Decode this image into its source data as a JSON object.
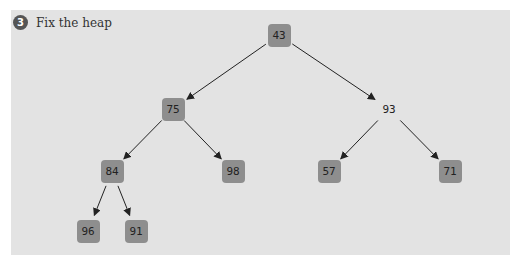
{
  "step": {
    "number": "3",
    "label": "Fix the heap"
  },
  "nodes": [
    {
      "id": "n0",
      "value": "43",
      "x": 279,
      "y": 35,
      "boxed": true
    },
    {
      "id": "n1",
      "value": "75",
      "x": 173,
      "y": 109,
      "boxed": true
    },
    {
      "id": "n2",
      "value": "93",
      "x": 389,
      "y": 109,
      "boxed": false
    },
    {
      "id": "n3",
      "value": "84",
      "x": 112,
      "y": 171,
      "boxed": true
    },
    {
      "id": "n4",
      "value": "98",
      "x": 233,
      "y": 171,
      "boxed": true
    },
    {
      "id": "n5",
      "value": "57",
      "x": 329,
      "y": 171,
      "boxed": true
    },
    {
      "id": "n6",
      "value": "71",
      "x": 450,
      "y": 171,
      "boxed": true
    },
    {
      "id": "n7",
      "value": "96",
      "x": 88,
      "y": 231,
      "boxed": true
    },
    {
      "id": "n8",
      "value": "91",
      "x": 136,
      "y": 231,
      "boxed": true
    }
  ],
  "edges": [
    [
      "n0",
      "n1"
    ],
    [
      "n0",
      "n2"
    ],
    [
      "n1",
      "n3"
    ],
    [
      "n1",
      "n4"
    ],
    [
      "n2",
      "n5"
    ],
    [
      "n2",
      "n6"
    ],
    [
      "n3",
      "n7"
    ],
    [
      "n3",
      "n8"
    ]
  ]
}
